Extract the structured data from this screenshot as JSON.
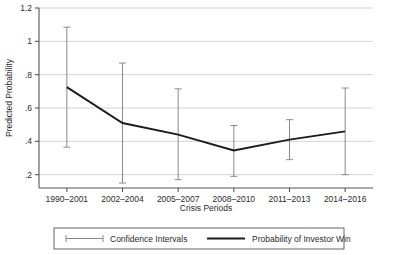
{
  "chart_data": {
    "type": "line",
    "title": "",
    "xlabel": "Crisis Periods",
    "ylabel": "Predicted Probability",
    "categories": [
      "1990–2001",
      "2002–2004",
      "2005–2007",
      "2008–2010",
      "2011–2013",
      "2014–2016"
    ],
    "ytick_labels": [
      "1.2",
      "1",
      ".8",
      ".6",
      ".4",
      ".2"
    ],
    "ytick_values": [
      1.2,
      1.0,
      0.8,
      0.6,
      0.4,
      0.2
    ],
    "ylim": [
      0.12,
      1.2
    ],
    "grid": "horizontal",
    "legend_position": "below-plot",
    "series": [
      {
        "name": "Probability of Investor Win",
        "values": [
          0.725,
          0.51,
          0.44,
          0.345,
          0.41,
          0.46
        ]
      }
    ],
    "error_bars": {
      "name": "Confidence Intervals",
      "lower": [
        0.365,
        0.15,
        0.17,
        0.19,
        0.29,
        0.2
      ],
      "upper": [
        1.085,
        0.87,
        0.715,
        0.495,
        0.53,
        0.72
      ]
    },
    "legend_entries": [
      {
        "label": "Confidence Intervals",
        "marker": "errorbar"
      },
      {
        "label": "Probability of Investor Win",
        "marker": "line"
      }
    ],
    "colors": {
      "line": "#1c1c1c",
      "error_bar": "#8a8a8a",
      "grid": "#c9c9c9",
      "axis": "#555555",
      "background": "#ffffff"
    }
  }
}
